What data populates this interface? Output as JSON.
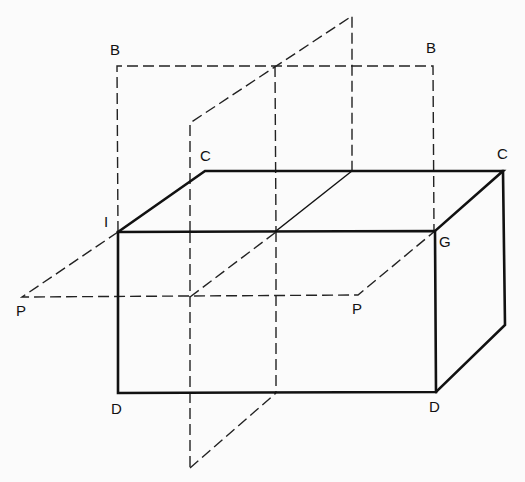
{
  "diagram": {
    "type": "isometric box with intersecting planes",
    "stroke_color": "#111111",
    "background": "#fbfbfb",
    "labels": [
      {
        "id": "B-left",
        "text": "B",
        "x": 110,
        "y": 42
      },
      {
        "id": "B-right",
        "text": "B",
        "x": 426,
        "y": 40
      },
      {
        "id": "C-left",
        "text": "C",
        "x": 200,
        "y": 148
      },
      {
        "id": "C-right",
        "text": "C",
        "x": 497,
        "y": 146
      },
      {
        "id": "I",
        "text": "I",
        "x": 104,
        "y": 214
      },
      {
        "id": "G",
        "text": "G",
        "x": 439,
        "y": 234
      },
      {
        "id": "P-left",
        "text": "P",
        "x": 16,
        "y": 303
      },
      {
        "id": "P-right",
        "text": "P",
        "x": 352,
        "y": 301
      },
      {
        "id": "D-left",
        "text": "D",
        "x": 111,
        "y": 401
      },
      {
        "id": "D-right",
        "text": "D",
        "x": 429,
        "y": 399
      }
    ],
    "box": {
      "front_face": [
        [
          118,
          232
        ],
        [
          435,
          231
        ],
        [
          436,
          392
        ],
        [
          118,
          393
        ]
      ],
      "top_back_edge": [
        [
          205,
          171
        ],
        [
          503,
          171
        ]
      ],
      "right_back_edge": [
        [
          503,
          171
        ],
        [
          505,
          325
        ]
      ],
      "right_bottom_edge": [
        [
          436,
          392
        ],
        [
          505,
          325
        ]
      ]
    },
    "planes": {
      "B": "vertical frontal plane, dashed rectangle above box",
      "P": "horizontal plane, dashed parallelogram",
      "C": "vertical profile plane, dashed parallelogram"
    }
  }
}
